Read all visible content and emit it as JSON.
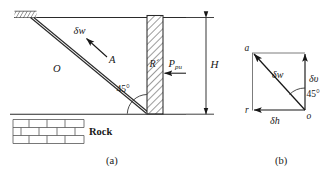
{
  "figure": {
    "title": "",
    "panels": [
      {
        "id": "a",
        "caption": "(a)",
        "name": "passive-wedge-diagram",
        "labels": {
          "delta_w": "δw",
          "point_a": "A",
          "point_o": "O",
          "reaction_r": "R´",
          "force_ppu": "P",
          "force_ppu_sub": "pu",
          "angle": "45°",
          "height": "H",
          "rock": "Rock"
        }
      },
      {
        "id": "b",
        "caption": "(b)",
        "name": "velocity-hodograph",
        "labels": {
          "node_a": "a",
          "node_r": "r",
          "node_o": "o",
          "delta_w": "δw",
          "delta_v": "δυ",
          "delta_h": "δh",
          "angle": "45°"
        }
      }
    ],
    "colors": {
      "ink": "#171717",
      "line": "#2a2a2a",
      "hatch": "#3a3a3a",
      "background": "#ffffff"
    }
  }
}
